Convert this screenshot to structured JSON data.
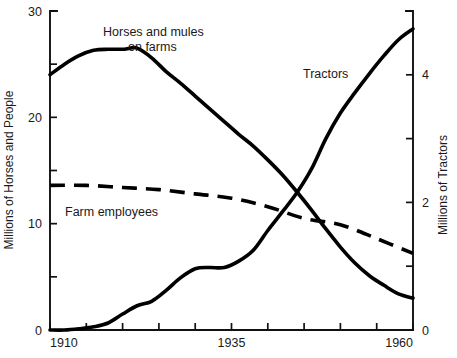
{
  "chart_data": {
    "type": "line",
    "title": "",
    "xlabel": "",
    "ylabel": "Millions of Horses and People",
    "y2label": "Millions of Tractors",
    "xlim": [
      1910,
      1960
    ],
    "ylim": [
      0,
      30
    ],
    "y2lim": [
      0,
      5
    ],
    "grid": false,
    "legend_position": "inline-annotations",
    "x_ticks": [
      1910,
      1915,
      1920,
      1925,
      1930,
      1935,
      1940,
      1945,
      1950,
      1955,
      1960
    ],
    "x_tick_labels": [
      "1910",
      "",
      "",
      "",
      "",
      "1935",
      "",
      "",
      "",
      "",
      "1960"
    ],
    "y_ticks": [
      0,
      5,
      10,
      15,
      20,
      25,
      30
    ],
    "y_tick_labels": [
      "0",
      "",
      "10",
      "",
      "20",
      "",
      "30"
    ],
    "y2_ticks": [
      0,
      1,
      2,
      3,
      4,
      5
    ],
    "y2_tick_labels": [
      "0",
      "",
      "2",
      "",
      "4",
      ""
    ],
    "series": [
      {
        "name": "Horses and mules on farms",
        "axis": "left",
        "style": "solid",
        "label": "Horses and mules\non farms",
        "label_line1": "Horses and mules",
        "label_line2": "on farms",
        "x": [
          1910,
          1912,
          1914,
          1916,
          1918,
          1920,
          1921,
          1922,
          1924,
          1926,
          1928,
          1930,
          1932,
          1934,
          1936,
          1938,
          1940,
          1942,
          1944,
          1946,
          1948,
          1950,
          1952,
          1954,
          1956,
          1958,
          1960
        ],
        "values": [
          24.0,
          25.0,
          25.8,
          26.3,
          26.4,
          26.4,
          26.5,
          26.5,
          25.6,
          24.3,
          23.2,
          22.0,
          20.8,
          19.6,
          18.4,
          17.3,
          16.0,
          14.6,
          13.0,
          11.3,
          9.5,
          7.8,
          6.3,
          5.1,
          4.2,
          3.4,
          3.0
        ]
      },
      {
        "name": "Tractors",
        "axis": "right",
        "style": "solid",
        "label": "Tractors",
        "x": [
          1910,
          1912,
          1914,
          1916,
          1918,
          1920,
          1922,
          1924,
          1926,
          1928,
          1930,
          1932,
          1934,
          1936,
          1938,
          1940,
          1942,
          1944,
          1946,
          1948,
          1950,
          1952,
          1954,
          1956,
          1958,
          1960
        ],
        "values": [
          0.0,
          0.0,
          0.02,
          0.05,
          0.11,
          0.25,
          0.38,
          0.45,
          0.62,
          0.82,
          0.96,
          0.98,
          0.98,
          1.08,
          1.25,
          1.56,
          1.85,
          2.15,
          2.52,
          3.0,
          3.4,
          3.72,
          4.02,
          4.3,
          4.55,
          4.72
        ]
      },
      {
        "name": "Farm employees",
        "axis": "left",
        "style": "dashed",
        "label": "Farm employees",
        "x": [
          1910,
          1915,
          1920,
          1925,
          1930,
          1935,
          1940,
          1945,
          1950,
          1955,
          1960
        ],
        "values": [
          13.6,
          13.6,
          13.4,
          13.2,
          12.8,
          12.4,
          11.6,
          10.5,
          9.9,
          8.6,
          7.2
        ]
      }
    ],
    "annotations": [
      {
        "text": "Horses and mules",
        "x_px": 103,
        "y_px": 36
      },
      {
        "text": "on farms",
        "x_px": 128,
        "y_px": 51
      },
      {
        "text": "Tractors",
        "x_px": 303,
        "y_px": 78
      },
      {
        "text": "Farm employees",
        "x_px": 65,
        "y_px": 216
      }
    ],
    "colors": {
      "line": "#000000",
      "axis": "#111111",
      "text": "#1a1a1a",
      "background": "#ffffff"
    }
  }
}
